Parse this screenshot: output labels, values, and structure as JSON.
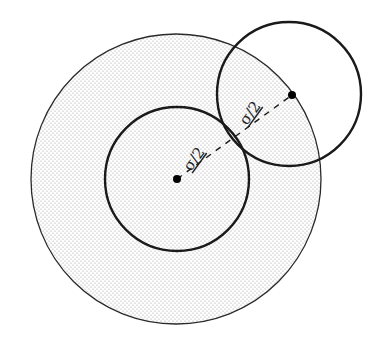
{
  "diagram": {
    "labels": {
      "inner_radius": "σ/2",
      "outer_radius": "σ/2"
    },
    "colors": {
      "stroke": "#1a1a1a",
      "shade_dots": "#9a9a9a",
      "background": "#ffffff"
    },
    "shapes": {
      "excluded_volume_circle": {
        "cx": 176,
        "cy": 179,
        "r": 145
      },
      "central_particle": {
        "cx": 177,
        "cy": 179,
        "r": 72
      },
      "neighbor_particle": {
        "cx": 289,
        "cy": 94,
        "r": 72
      },
      "center_dot_1": {
        "cx": 177,
        "cy": 179
      },
      "center_dot_2": {
        "cx": 292,
        "cy": 95
      }
    }
  }
}
